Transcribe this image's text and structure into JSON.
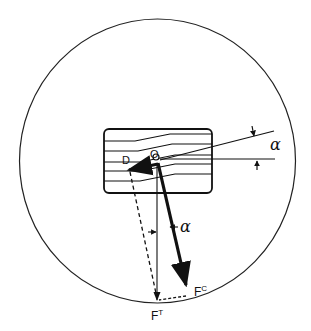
{
  "diagram": {
    "labels": {
      "point_d": "D",
      "point_o": "O",
      "alpha_right": "α",
      "alpha_lower": "α",
      "force_t": "F",
      "force_t_sup": "T",
      "force_c": "F",
      "force_c_sup": "C"
    },
    "colors": {
      "stroke": "#111111",
      "background": "#ffffff"
    }
  }
}
